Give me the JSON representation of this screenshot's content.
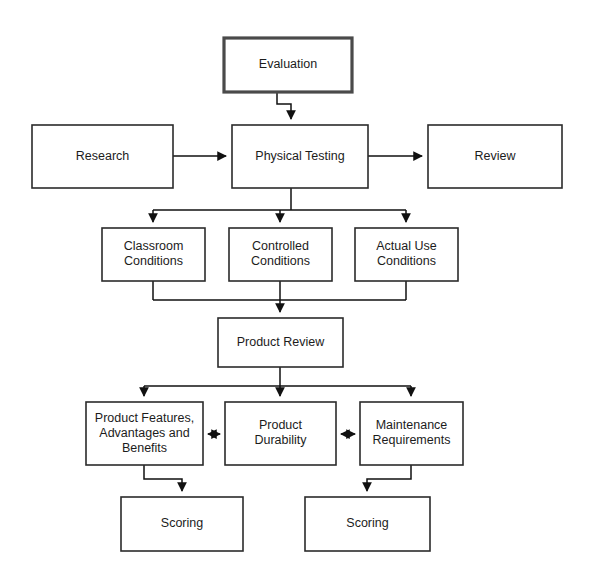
{
  "diagram": {
    "background_color": "#ffffff",
    "line_color": "#111111",
    "box_fill": "#ffffff",
    "box_stroke": "#2b2b2b",
    "emphasis_stroke": "#4a4a4a",
    "text_color": "#1c1c1c"
  },
  "nodes": {
    "evaluation": {
      "label": "Evaluation",
      "lines": [
        "Evaluation"
      ],
      "x": 224,
      "y": 38,
      "w": 128,
      "h": 54,
      "emphasis": true
    },
    "research": {
      "label": "Research",
      "lines": [
        "Research"
      ],
      "x": 32,
      "y": 125,
      "w": 141,
      "h": 63,
      "emphasis": false
    },
    "physical_testing": {
      "label": "Physical Testing",
      "lines": [
        "Physical Testing"
      ],
      "x": 232,
      "y": 125,
      "w": 136,
      "h": 63,
      "emphasis": false
    },
    "review": {
      "label": "Review",
      "lines": [
        "Review"
      ],
      "x": 428,
      "y": 125,
      "w": 134,
      "h": 63,
      "emphasis": false
    },
    "classroom_conditions": {
      "label": "Classroom Conditions",
      "lines": [
        "Classroom",
        "Conditions"
      ],
      "x": 102,
      "y": 228,
      "w": 103,
      "h": 53,
      "emphasis": false
    },
    "controlled_conditions": {
      "label": "Controlled Conditions",
      "lines": [
        "Controlled",
        "Conditions"
      ],
      "x": 229,
      "y": 228,
      "w": 103,
      "h": 53,
      "emphasis": false
    },
    "actual_use_conditions": {
      "label": "Actual Use Conditions",
      "lines": [
        "Actual Use",
        "Conditions"
      ],
      "x": 355,
      "y": 228,
      "w": 103,
      "h": 53,
      "emphasis": false
    },
    "product_review": {
      "label": "Product Review",
      "lines": [
        "Product Review"
      ],
      "x": 218,
      "y": 318,
      "w": 125,
      "h": 49,
      "emphasis": false
    },
    "product_features": {
      "label": "Product Features, Advantages and Benefits",
      "lines": [
        "Product Features,",
        "Advantages and",
        "Benefits"
      ],
      "x": 86,
      "y": 402,
      "w": 117,
      "h": 63,
      "emphasis": false
    },
    "product_durability": {
      "label": "Product Durability",
      "lines": [
        "Product",
        "Durability"
      ],
      "x": 225,
      "y": 402,
      "w": 111,
      "h": 63,
      "emphasis": false
    },
    "maintenance_requirements": {
      "label": "Maintenance Requirements",
      "lines": [
        "Maintenance",
        "Requirements"
      ],
      "x": 360,
      "y": 402,
      "w": 103,
      "h": 63,
      "emphasis": false
    },
    "scoring_left": {
      "label": "Scoring",
      "lines": [
        "Scoring"
      ],
      "x": 121,
      "y": 497,
      "w": 122,
      "h": 54,
      "emphasis": false
    },
    "scoring_right": {
      "label": "Scoring",
      "lines": [
        "Scoring"
      ],
      "x": 305,
      "y": 497,
      "w": 125,
      "h": 54,
      "emphasis": false
    }
  },
  "edges": [
    {
      "name": "evaluation-to-physical-testing",
      "from": "evaluation",
      "to": "physical_testing",
      "style": "elbow",
      "arrow": "single",
      "path": "M 277 92 L 277 104 L 291 104 L 291 119"
    },
    {
      "name": "research-to-physical-testing",
      "from": "research",
      "to": "physical_testing",
      "style": "straight",
      "arrow": "single",
      "path": "M 173 156 L 226 156"
    },
    {
      "name": "physical-testing-to-review",
      "from": "physical_testing",
      "to": "review",
      "style": "straight",
      "arrow": "single",
      "path": "M 368 156 L 422 156"
    },
    {
      "name": "physical-testing-to-conditions",
      "from": "physical_testing",
      "to": "conditions_row",
      "style": "fan",
      "arrow": "single",
      "path": "M 291 188 L 291 210 M 153 210 L 406 210 M 153 210 L 153 222 M 280 210 L 280 222 M 406 210 L 406 222"
    },
    {
      "name": "conditions-to-product-review",
      "from": "conditions_row",
      "to": "product_review",
      "style": "merge",
      "arrow": "single",
      "path": "M 153 281 L 153 300 M 406 281 L 406 300 M 153 300 L 406 300 M 280 281 L 280 312"
    },
    {
      "name": "product-review-to-criteria",
      "from": "product_review",
      "to": "criteria_row",
      "style": "fan",
      "arrow": "single",
      "path": "M 280 367 L 280 386 M 144 386 L 411 386 M 144 386 L 144 396 M 280 386 L 280 396 M 411 386 L 411 396"
    },
    {
      "name": "features-to-durability",
      "from": "product_features",
      "to": "product_durability",
      "style": "straight",
      "arrow": "double",
      "path": "M 208 434 L 220 434"
    },
    {
      "name": "durability-to-maintenance",
      "from": "product_durability",
      "to": "maintenance_requirements",
      "style": "straight",
      "arrow": "double",
      "path": "M 341 434 L 355 434"
    },
    {
      "name": "features-to-scoring-left",
      "from": "product_features",
      "to": "scoring_left",
      "style": "elbow",
      "arrow": "single",
      "path": "M 144 465 L 144 479 L 182 479 L 182 491"
    },
    {
      "name": "maintenance-to-scoring-right",
      "from": "maintenance_requirements",
      "to": "scoring_right",
      "style": "elbow",
      "arrow": "single",
      "path": "M 411 465 L 411 479 L 367 479 L 367 491"
    }
  ]
}
